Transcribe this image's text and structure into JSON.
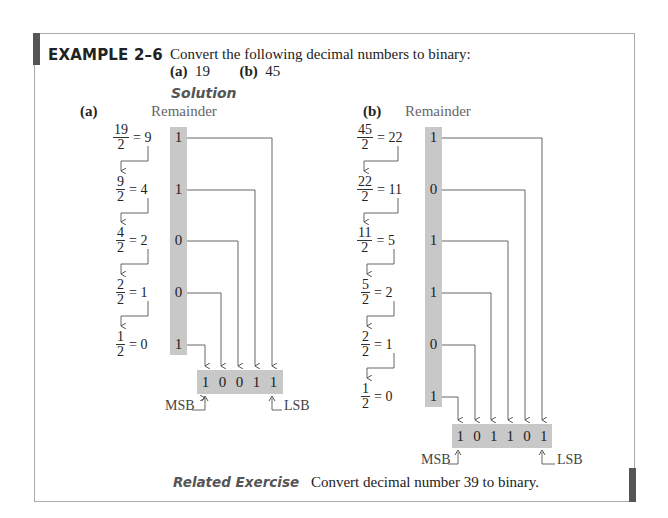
{
  "example": {
    "title": "EXAMPLE 2–6",
    "statement": "Convert the following decimal numbers to binary:",
    "parts": [
      {
        "label": "(a)",
        "value": "19"
      },
      {
        "label": "(b)",
        "value": "45"
      }
    ],
    "solution_heading": "Solution"
  },
  "part_a": {
    "label": "(a)",
    "remainder_header": "Remainder",
    "steps": [
      {
        "num": "19",
        "den": "2",
        "result": "= 9",
        "remainder": "1"
      },
      {
        "num": "9",
        "den": "2",
        "result": "= 4",
        "remainder": "1"
      },
      {
        "num": "4",
        "den": "2",
        "result": "= 2",
        "remainder": "0"
      },
      {
        "num": "2",
        "den": "2",
        "result": "= 1",
        "remainder": "0"
      },
      {
        "num": "1",
        "den": "2",
        "result": "= 0",
        "remainder": "1"
      }
    ],
    "result_bits": [
      "1",
      "0",
      "0",
      "1",
      "1"
    ],
    "msb_label": "MSB",
    "lsb_label": "LSB"
  },
  "part_b": {
    "label": "(b)",
    "remainder_header": "Remainder",
    "steps": [
      {
        "num": "45",
        "den": "2",
        "result": "= 22",
        "remainder": "1"
      },
      {
        "num": "22",
        "den": "2",
        "result": "= 11",
        "remainder": "0"
      },
      {
        "num": "11",
        "den": "2",
        "result": "= 5",
        "remainder": "1"
      },
      {
        "num": "5",
        "den": "2",
        "result": "= 2",
        "remainder": "1"
      },
      {
        "num": "2",
        "den": "2",
        "result": "= 1",
        "remainder": "0"
      },
      {
        "num": "1",
        "den": "2",
        "result": "= 0",
        "remainder": "1"
      }
    ],
    "result_bits": [
      "1",
      "0",
      "1",
      "1",
      "0",
      "1"
    ],
    "msb_label": "MSB",
    "lsb_label": "LSB"
  },
  "related_exercise": {
    "heading": "Related Exercise",
    "text": "Convert decimal number 39 to binary."
  },
  "colors": {
    "shade": "#c8c8c8",
    "accent_bar": "#555555",
    "frame": "#aaaaaa"
  }
}
